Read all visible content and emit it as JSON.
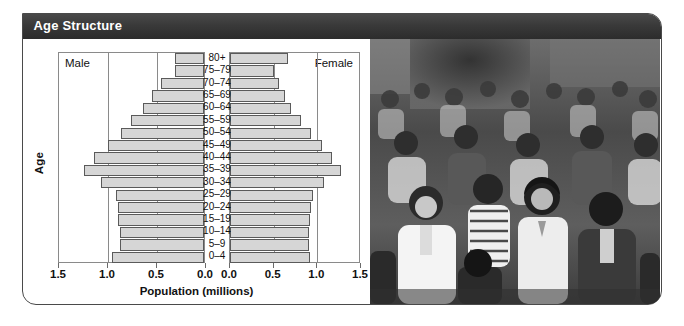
{
  "card": {
    "header_title": "Age Structure"
  },
  "chart_data": {
    "type": "bar",
    "subtype": "population-pyramid",
    "title": "Age Structure",
    "xlabel": "Population (millions)",
    "ylabel": "Age",
    "xlim": [
      0,
      1.5
    ],
    "x_ticks_left": [
      "1.5",
      "1.0",
      "0.5",
      "0.0"
    ],
    "x_ticks_right": [
      "0.0",
      "0.5",
      "1.0",
      "1.5"
    ],
    "x_tick_values": [
      1.5,
      1.0,
      0.5,
      0.0
    ],
    "grid": true,
    "legend_position": "inside-top-corners",
    "categories": [
      "80+",
      "75–79",
      "70–74",
      "65–69",
      "60–64",
      "55–59",
      "50–54",
      "45–49",
      "40–44",
      "35–39",
      "30–34",
      "25–29",
      "20–24",
      "15–19",
      "10–14",
      "5–9",
      "0–4"
    ],
    "series": [
      {
        "name": "Male",
        "side": "left",
        "values": [
          0.3,
          0.3,
          0.44,
          0.53,
          0.62,
          0.74,
          0.85,
          0.98,
          1.12,
          1.22,
          1.05,
          0.9,
          0.88,
          0.88,
          0.86,
          0.86,
          0.94
        ]
      },
      {
        "name": "Female",
        "side": "right",
        "values": [
          0.66,
          0.5,
          0.56,
          0.63,
          0.7,
          0.81,
          0.93,
          1.05,
          1.17,
          1.27,
          1.08,
          0.95,
          0.93,
          0.92,
          0.91,
          0.9,
          0.92
        ]
      }
    ]
  },
  "photo": {
    "caption": "crowd-of-people-street-scene-black-and-white",
    "alt": "Black and white photograph of a dense crowd of people walking on a city street"
  }
}
